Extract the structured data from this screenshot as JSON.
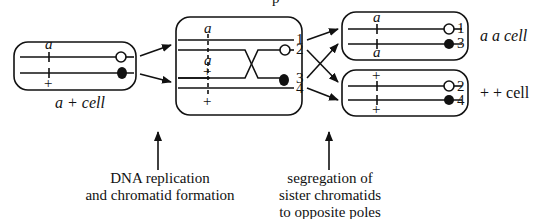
{
  "diagram": {
    "title_fragment": "p",
    "left_cell": {
      "label_allele1": "a",
      "label_allele2": "+",
      "caption": "a +  cell"
    },
    "middle_cell": {
      "allele_labels": [
        "a",
        "a",
        "+",
        "+"
      ],
      "chromatid_numbers": [
        "1",
        "2",
        "3",
        "4"
      ]
    },
    "top_right_cell": {
      "allele_labels": [
        "a",
        "a"
      ],
      "chromatid_numbers": [
        "1",
        "3"
      ],
      "caption": "a a  cell"
    },
    "bottom_right_cell": {
      "allele_labels": [
        "+",
        "+"
      ],
      "chromatid_numbers": [
        "2",
        "4"
      ],
      "caption": "+ +  cell"
    },
    "annotations": {
      "replication_line1": "DNA replication",
      "replication_line2": "and chromatid formation",
      "segregation_line1": "segregation of",
      "segregation_line2": "sister chromatids",
      "segregation_line3": "to opposite poles"
    },
    "colors": {
      "ink": "#111111",
      "background": "#ffffff"
    }
  }
}
